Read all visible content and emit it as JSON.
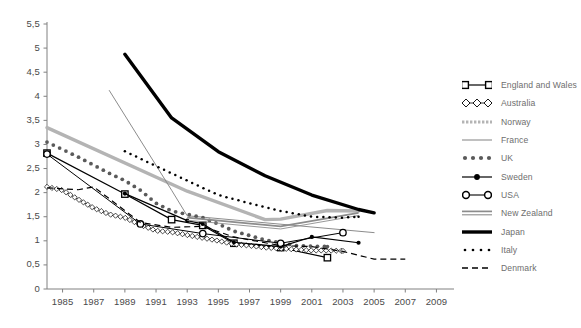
{
  "chart_data": {
    "type": "line",
    "title": "",
    "xlabel": "",
    "ylabel": "",
    "xlim": [
      1984,
      2010
    ],
    "ylim": [
      0,
      5.5
    ],
    "yticks": [
      "0",
      "0,5",
      "1",
      "1,5",
      "2",
      "2,5",
      "3",
      "3,5",
      "4",
      "4,5",
      "5",
      "5,5"
    ],
    "ytick_values": [
      0,
      0.5,
      1,
      1.5,
      2,
      2.5,
      3,
      3.5,
      4,
      4.5,
      5,
      5.5
    ],
    "xticks": [
      "1985",
      "1987",
      "1989",
      "1991",
      "1993",
      "1995",
      "1997",
      "1999",
      "2001",
      "2003",
      "2005",
      "2007",
      "2009"
    ],
    "xtick_values": [
      1985,
      1987,
      1989,
      1991,
      1993,
      1995,
      1997,
      1999,
      2001,
      2003,
      2005,
      2007,
      2009
    ],
    "grid": false,
    "legend_position": "right",
    "decimal_separator": ",",
    "series": [
      {
        "name": "England and Wales",
        "style": "solid-open-square",
        "color": "#000000",
        "width": 1.2,
        "marker": "open-square",
        "x": [
          1984,
          1989,
          1992,
          1994,
          1996,
          1999,
          2002
        ],
        "values": [
          2.82,
          1.97,
          1.44,
          1.32,
          0.95,
          0.86,
          0.65
        ]
      },
      {
        "name": "Australia",
        "style": "open-diamond-chain",
        "color": "#000000",
        "width": 0.8,
        "marker": "open-diamond",
        "x": [
          1984,
          1985,
          1986,
          1987,
          1988,
          1989,
          1990,
          1991,
          1992,
          1993,
          1994,
          1995,
          1996,
          1997,
          1998,
          1999,
          2000,
          2001,
          2002,
          2003
        ],
        "values": [
          2.12,
          2.05,
          1.86,
          1.68,
          1.55,
          1.48,
          1.33,
          1.21,
          1.18,
          1.12,
          1.06,
          1.0,
          0.93,
          0.9,
          0.86,
          0.84,
          0.82,
          0.8,
          0.8,
          0.79
        ]
      },
      {
        "name": "Norway",
        "style": "thick-light-gray",
        "color": "#b4b4b4",
        "width": 3.4,
        "marker": "none",
        "x": [
          1984,
          1993,
          1998,
          1999,
          2002,
          2004
        ],
        "values": [
          3.35,
          2.03,
          1.44,
          1.45,
          1.63,
          1.62
        ]
      },
      {
        "name": "France",
        "style": "thin-gray",
        "color": "#8c8c8c",
        "width": 1.0,
        "marker": "none",
        "x": [
          1988,
          1992,
          1993,
          2005
        ],
        "values": [
          4.12,
          2.05,
          1.52,
          1.17
        ]
      },
      {
        "name": "UK",
        "style": "large-dotted-gray",
        "color": "#5a5a5a",
        "width": 3.0,
        "marker": "none",
        "x": [
          1984,
          1986,
          1988,
          1989,
          1990,
          1991,
          1992,
          1993,
          1994,
          1995,
          1996,
          1998,
          2000,
          2002
        ],
        "values": [
          3.05,
          2.74,
          2.4,
          2.25,
          2.05,
          1.78,
          1.62,
          1.55,
          1.48,
          1.35,
          1.2,
          1.02,
          0.9,
          0.88
        ]
      },
      {
        "name": "Sweden",
        "style": "solid-filled-dot",
        "color": "#000000",
        "width": 1.2,
        "marker": "filled-circle",
        "x": [
          1989,
          1993,
          1994,
          1996,
          1999,
          2001,
          2004
        ],
        "values": [
          1.98,
          1.42,
          1.35,
          0.97,
          0.88,
          1.08,
          0.96
        ]
      },
      {
        "name": "USA",
        "style": "solid-open-circle",
        "color": "#000000",
        "width": 1.0,
        "marker": "open-circle",
        "x": [
          1984,
          1990,
          1994,
          1999,
          2003
        ],
        "values": [
          2.8,
          1.35,
          1.15,
          0.95,
          1.17
        ]
      },
      {
        "name": "New Zealand",
        "style": "medium-gray-flat",
        "color": "#8c8c8c",
        "width": 1.8,
        "marker": "none",
        "x": [
          1993,
          1999,
          2004
        ],
        "values": [
          1.48,
          1.3,
          1.58
        ]
      },
      {
        "name": "Japan",
        "style": "thick-black",
        "color": "#000000",
        "width": 3.4,
        "marker": "none",
        "x": [
          1989,
          1992,
          1995,
          1998,
          2001,
          2004,
          2005
        ],
        "values": [
          4.87,
          3.55,
          2.85,
          2.35,
          1.95,
          1.65,
          1.58
        ]
      },
      {
        "name": "Italy",
        "style": "small-dotted-black",
        "color": "#000000",
        "width": 2.0,
        "marker": "none",
        "x": [
          1989,
          1991,
          1993,
          1995,
          1997,
          1999,
          2001,
          2003,
          2004
        ],
        "values": [
          2.86,
          2.55,
          2.25,
          1.95,
          1.78,
          1.62,
          1.5,
          1.48,
          1.5
        ]
      },
      {
        "name": "Denmark",
        "style": "dashed-black",
        "color": "#000000",
        "width": 1.2,
        "marker": "none",
        "x": [
          1984,
          1986,
          1987,
          1990,
          1992,
          1994,
          1996,
          1999,
          2001,
          2003,
          2005,
          2007
        ],
        "values": [
          2.1,
          2.06,
          2.12,
          1.38,
          1.28,
          1.3,
          1.08,
          0.9,
          0.88,
          0.78,
          0.62,
          0.62
        ]
      }
    ]
  },
  "legend": {
    "items": [
      {
        "label": "England and Wales",
        "key": "open-square-line"
      },
      {
        "label": "Australia",
        "key": "open-diamond-chain"
      },
      {
        "label": "Norway",
        "key": "dotted-gray-bar"
      },
      {
        "label": "France",
        "key": "thin-gray-line"
      },
      {
        "label": "UK",
        "key": "thick-dotted-gray"
      },
      {
        "label": "Sweden",
        "key": "filled-dot-line"
      },
      {
        "label": "USA",
        "key": "open-circle-line"
      },
      {
        "label": "New Zealand",
        "key": "double-gray-line"
      },
      {
        "label": "Japan",
        "key": "thick-black-line"
      },
      {
        "label": "Italy",
        "key": "small-dotted-black"
      },
      {
        "label": "Denmark",
        "key": "dashed-black-line"
      }
    ]
  },
  "axes": {
    "axis_color": "#808080",
    "label_color": "#4a4a4a"
  }
}
